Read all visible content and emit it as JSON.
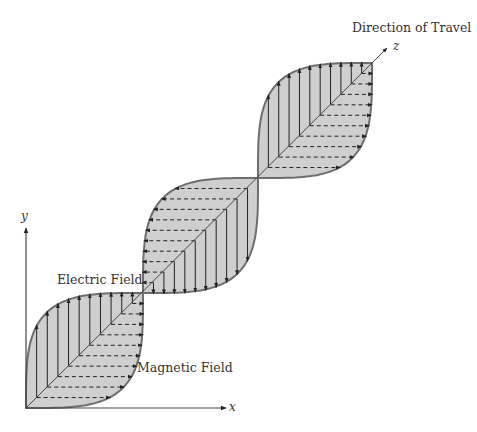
{
  "labels": {
    "direction": "Direction of Travel",
    "electric": "Electric Field",
    "magnetic": "Magnetic Field",
    "x_axis": "x",
    "y_axis": "y",
    "z_axis": "z"
  },
  "colors": {
    "fill": "#cfcfcf",
    "stroke": "#6e6e6e",
    "arrow": "#222222",
    "text": "#333333"
  },
  "geometry": {
    "origin": [
      26,
      408
    ],
    "x_axis_end": [
      226,
      408
    ],
    "y_axis_end": [
      26,
      228
    ],
    "nodes": [
      [
        26,
        408
      ],
      [
        143,
        293
      ],
      [
        258,
        178
      ],
      [
        372,
        63
      ]
    ],
    "z_arrow_end": [
      387,
      48
    ],
    "vectors_per_segment": 10
  },
  "segments": [
    {
      "vertical_dir": "down",
      "dashed_dir": "left"
    },
    {
      "vertical_dir": "up",
      "dashed_dir": "right"
    },
    {
      "vertical_dir": "down",
      "dashed_dir": "left"
    }
  ]
}
